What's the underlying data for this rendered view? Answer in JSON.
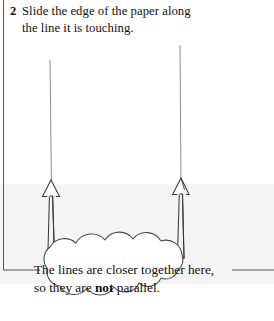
{
  "instruction": {
    "number": "2",
    "line1": "Slide the edge of the paper along",
    "line2": "the line it is touching."
  },
  "callout": {
    "line1_pre": "The lines are closer together here,",
    "line2_pre": "so they are ",
    "line2_emph": "not",
    "line2_post": " parallel."
  },
  "figure": {
    "left_line_label": "left-guide-line",
    "right_line_label": "right-guide-line",
    "left_arrow_label": "left-up-arrow",
    "right_arrow_label": "right-up-arrow",
    "paper_edge_label": "paper-edge-line",
    "shaded_region_label": "paper-shaded-region"
  },
  "colors": {
    "ink": "#121212",
    "line": "#6b6b6b",
    "stroke": "#3a3a3a",
    "paper_gray": "#f4f4f4",
    "page_bg": "#ffffff"
  }
}
